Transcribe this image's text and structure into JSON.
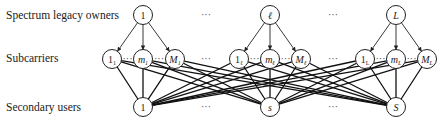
{
  "labels": {
    "owners": "Spectrum legacy owners",
    "subcarriers": "Subcarriers",
    "users": "Secondary users"
  },
  "owners": [
    {
      "id": "1",
      "x": 143
    },
    {
      "id": "ℓ",
      "x": 270
    },
    {
      "id": "L",
      "x": 396
    }
  ],
  "subcarriers": [
    {
      "group": "1",
      "nodes": [
        {
          "main": "1",
          "sub": "1",
          "x": 112
        },
        {
          "main": "m",
          "sub": "1",
          "x": 143
        },
        {
          "main": "M",
          "sub": "1",
          "x": 175
        }
      ]
    },
    {
      "group": "ℓ",
      "nodes": [
        {
          "main": "1",
          "sub": "ℓ",
          "x": 239
        },
        {
          "main": "m",
          "sub": "ℓ",
          "x": 270
        },
        {
          "main": "M",
          "sub": "ℓ",
          "x": 301
        }
      ]
    },
    {
      "group": "L",
      "nodes": [
        {
          "main": "1",
          "sub": "L",
          "x": 365
        },
        {
          "main": "m",
          "sub": "L",
          "x": 396
        },
        {
          "main": "M",
          "sub": "L",
          "x": 427
        }
      ]
    }
  ],
  "users": [
    {
      "id": "1",
      "x": 143
    },
    {
      "id": "s",
      "x": 270
    },
    {
      "id": "S",
      "x": 396
    }
  ],
  "ellipsis": "···"
}
